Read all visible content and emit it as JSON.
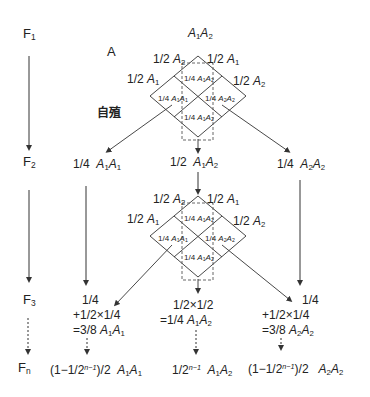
{
  "generations": {
    "f1": "F",
    "f1_sub": "1",
    "f2": "F",
    "f2_sub": "2",
    "f3": "F",
    "f3_sub": "3",
    "fn": "F",
    "fn_sub": "n"
  },
  "top": {
    "genotype": "A1A2",
    "label_a": "A",
    "selfing": "自殖"
  },
  "gametes": {
    "upper_left": "1/2",
    "upper_left_allele": "A2",
    "upper_right": "1/2",
    "upper_right_allele": "A1",
    "left": "1/2",
    "left_allele": "A1",
    "right": "1/2",
    "right_allele": "A2"
  },
  "punnett": {
    "top_cell": "1/4 A1A2",
    "left_cell": "1/4 A1A1",
    "right_cell": "1/4 A2A2",
    "bottom_cell": "1/4 A1A2"
  },
  "f2_row": {
    "left": "1/4",
    "left_genotype": "A1A1",
    "center": "1/2",
    "center_genotype": "A1A2",
    "right": "1/4",
    "right_genotype": "A2A2"
  },
  "f3_row": {
    "left_line1": "1/4",
    "left_line2": "+1/2×1/4",
    "left_line3": "=3/8",
    "left_genotype": "A1A1",
    "center_line1": "1/2×1/2",
    "center_line2": "=1/4",
    "center_genotype": "A1A2",
    "right_line1": "1/4",
    "right_line2": "+1/2×1/4",
    "right_line3": "=3/8",
    "right_genotype": "A2A2"
  },
  "fn_row": {
    "left": "(1−1/2",
    "left_exp": "n−1",
    "left_tail": ")/2",
    "left_genotype": "A1A1",
    "center": "1/2",
    "center_exp": "n−1",
    "center_genotype": "A1A2",
    "right": "(1−1/2",
    "right_exp": "n−1",
    "right_tail": ")/2",
    "right_genotype": "A2A2"
  },
  "colors": {
    "line": "#333333",
    "text": "#222222",
    "dashed": "#555555"
  }
}
